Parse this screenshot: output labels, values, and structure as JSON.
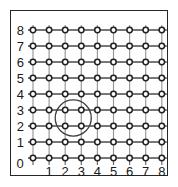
{
  "figure": {
    "background_color": "#ffffff",
    "frame_color": "#262626"
  },
  "chart_data": {
    "type": "scatter",
    "title": "",
    "xlabel": "",
    "ylabel": "",
    "xlim": [
      0,
      8
    ],
    "ylim": [
      0,
      8
    ],
    "grid": true,
    "legend": false,
    "marker": "open-circle",
    "x_tick_labels": [
      "0",
      "1",
      "2",
      "3",
      "4",
      "5",
      "6",
      "7",
      "8"
    ],
    "y_tick_labels": [
      "0",
      "1",
      "2",
      "3",
      "4",
      "5",
      "6",
      "7",
      "8"
    ],
    "x": [
      0,
      1,
      2,
      3,
      4,
      5,
      6,
      7,
      8
    ],
    "y": [
      0,
      1,
      2,
      3,
      4,
      5,
      6,
      7,
      8
    ],
    "points": [
      [
        0,
        0
      ],
      [
        1,
        0
      ],
      [
        2,
        0
      ],
      [
        3,
        0
      ],
      [
        4,
        0
      ],
      [
        5,
        0
      ],
      [
        6,
        0
      ],
      [
        7,
        0
      ],
      [
        8,
        0
      ],
      [
        0,
        1
      ],
      [
        1,
        1
      ],
      [
        2,
        1
      ],
      [
        3,
        1
      ],
      [
        4,
        1
      ],
      [
        5,
        1
      ],
      [
        6,
        1
      ],
      [
        7,
        1
      ],
      [
        8,
        1
      ],
      [
        0,
        2
      ],
      [
        1,
        2
      ],
      [
        2,
        2
      ],
      [
        3,
        2
      ],
      [
        4,
        2
      ],
      [
        5,
        2
      ],
      [
        6,
        2
      ],
      [
        7,
        2
      ],
      [
        8,
        2
      ],
      [
        0,
        3
      ],
      [
        1,
        3
      ],
      [
        2,
        3
      ],
      [
        3,
        3
      ],
      [
        4,
        3
      ],
      [
        5,
        3
      ],
      [
        6,
        3
      ],
      [
        7,
        3
      ],
      [
        8,
        3
      ],
      [
        0,
        4
      ],
      [
        1,
        4
      ],
      [
        2,
        4
      ],
      [
        3,
        4
      ],
      [
        4,
        4
      ],
      [
        5,
        4
      ],
      [
        6,
        4
      ],
      [
        7,
        4
      ],
      [
        8,
        4
      ],
      [
        0,
        5
      ],
      [
        1,
        5
      ],
      [
        2,
        5
      ],
      [
        3,
        5
      ],
      [
        4,
        5
      ],
      [
        5,
        5
      ],
      [
        6,
        5
      ],
      [
        7,
        5
      ],
      [
        8,
        5
      ],
      [
        0,
        6
      ],
      [
        1,
        6
      ],
      [
        2,
        6
      ],
      [
        3,
        6
      ],
      [
        4,
        6
      ],
      [
        5,
        6
      ],
      [
        6,
        6
      ],
      [
        7,
        6
      ],
      [
        8,
        6
      ],
      [
        0,
        7
      ],
      [
        1,
        7
      ],
      [
        2,
        7
      ],
      [
        3,
        7
      ],
      [
        4,
        7
      ],
      [
        5,
        7
      ],
      [
        6,
        7
      ],
      [
        7,
        7
      ],
      [
        8,
        7
      ],
      [
        0,
        8
      ],
      [
        1,
        8
      ],
      [
        2,
        8
      ],
      [
        3,
        8
      ],
      [
        4,
        8
      ],
      [
        5,
        8
      ],
      [
        6,
        8
      ],
      [
        7,
        8
      ],
      [
        8,
        8
      ]
    ],
    "point_count": 81,
    "annotations": [
      {
        "type": "circle",
        "center_x": 2.5,
        "center_y": 2.5,
        "radius": 1.12,
        "enclosed_points": [
          [
            2,
            2
          ],
          [
            3,
            2
          ],
          [
            2,
            3
          ],
          [
            3,
            3
          ]
        ],
        "stroke_color": "#3f3f3f",
        "fill": "none"
      }
    ]
  },
  "axes": {
    "y_labels": [
      "8",
      "7",
      "6",
      "5",
      "4",
      "3",
      "2",
      "1"
    ],
    "x_labels": [
      "1",
      "2",
      "3",
      "4",
      "5",
      "6",
      "7",
      "8"
    ],
    "origin_label": "0"
  },
  "style": {
    "horizontal_line_color": "#4a4a4a",
    "vertical_line_color": "#9a9a9a",
    "node_stroke_color": "#1f1f1f",
    "node_fill_color": "#ffffff",
    "tick_color": "#6b6b6b",
    "label_color": "#1a1a1a"
  }
}
